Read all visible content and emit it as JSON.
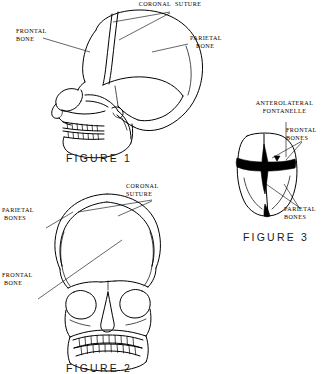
{
  "sheet": {
    "background_color": "#ffffff",
    "ink_color": "#000000"
  },
  "figures": [
    {
      "id": "figure-1",
      "caption": "FIGURE 1",
      "view": "lateral skull, adult",
      "labels": [
        {
          "name": "coronal-suture",
          "text": "CORONAL  SUTURE",
          "align": "center"
        },
        {
          "name": "frontal-bone",
          "text": "FRONTAL\nBONE",
          "align": "left"
        },
        {
          "name": "parietal-bone",
          "text": "PARIETAL\n   BONE",
          "align": "left"
        }
      ]
    },
    {
      "id": "figure-2",
      "caption": "FIGURE 2",
      "view": "anterior skull, adult",
      "labels": [
        {
          "name": "coronal-suture",
          "text": "CORONAL\nSUTURE",
          "align": "left"
        },
        {
          "name": "parietal-bones",
          "text": "PARIETAL\n BONES",
          "align": "left"
        },
        {
          "name": "frontal-bone",
          "text": "FRONTAL\n BONE",
          "align": "left"
        }
      ]
    },
    {
      "id": "figure-3",
      "caption": "FIGURE 3",
      "view": "infant skull, superior",
      "labels": [
        {
          "name": "anterolateral-fontanelle",
          "text": "ANTEROLATERAL\nFONTANELLE",
          "align": "center"
        },
        {
          "name": "frontal-bones",
          "text": "FRONTAL\nBONES",
          "align": "left"
        },
        {
          "name": "parietal-bones",
          "text": "PARIETAL\nBONES",
          "align": "left"
        }
      ]
    }
  ]
}
